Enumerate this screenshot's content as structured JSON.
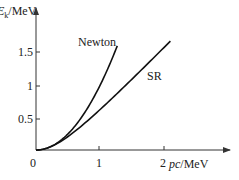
{
  "chart_data": {
    "type": "line",
    "title": "",
    "xlabel": "pc/MeV",
    "ylabel": "E_k/MeV",
    "ylabel_main": "E",
    "ylabel_sub": "k",
    "ylabel_unit": "/MeV",
    "xlabel_italic": "pc",
    "xlabel_unit": "/MeV",
    "xlim": [
      0,
      2.9
    ],
    "ylim": [
      0,
      2.2
    ],
    "x_ticks": [
      0,
      1,
      2
    ],
    "x_tick_labels": [
      "1",
      "2"
    ],
    "origin_label": "0",
    "y_ticks": [
      0.5,
      1,
      1.5
    ],
    "y_tick_labels": [
      "0.5",
      "1",
      "1.5"
    ],
    "grid": false,
    "legend": "inline labels",
    "rest_energy_MeV": 0.511,
    "series": [
      {
        "name": "Newton",
        "formula": "Ek = (pc)^2 / (2 mc^2)",
        "x": [
          0,
          0.25,
          0.5,
          0.75,
          1.0,
          1.1,
          1.2,
          1.27
        ],
        "y": [
          0,
          0.061,
          0.245,
          0.55,
          0.98,
          1.18,
          1.41,
          1.58
        ]
      },
      {
        "name": "SR",
        "formula": "Ek = sqrt((pc)^2 + (mc^2)^2) - mc^2",
        "x": [
          0,
          0.25,
          0.5,
          0.75,
          1.0,
          1.25,
          1.5,
          1.75,
          2.0,
          2.1
        ],
        "y": [
          0,
          0.058,
          0.204,
          0.397,
          0.612,
          0.839,
          1.074,
          1.312,
          1.553,
          1.65
        ]
      }
    ],
    "annotations": [
      {
        "text": "Newton",
        "near": "upper end of Newton curve"
      },
      {
        "text": "SR",
        "near": "right of SR curve, midway"
      }
    ]
  }
}
